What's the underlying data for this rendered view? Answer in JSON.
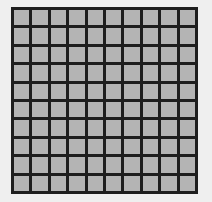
{
  "grid": {
    "rows": 10,
    "columns": 10,
    "cell_color": "#b4b4b4",
    "line_color": "#1e1e1e",
    "background_color": "#efefef"
  }
}
